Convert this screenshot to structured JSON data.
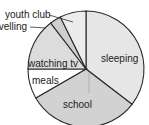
{
  "chart_data": {
    "type": "pie",
    "title": "",
    "unit": "hours",
    "total": 24,
    "start_angle_deg": 0,
    "direction": "clockwise",
    "categories": [
      "sleeping",
      "school",
      "meals",
      "watching tv",
      "travelling",
      "youth club"
    ],
    "values": [
      8.5,
      7.5,
      2,
      3.5,
      0.75,
      1.75
    ],
    "colors": [
      "#e6e6e6",
      "#d2d2d2",
      "#ffffff",
      "#dcdcdc",
      "#cfcfcf",
      "#ececec"
    ],
    "labels": {
      "sleeping": "sleeping",
      "school": "school",
      "meals": "meals",
      "watching_tv": "watching tv",
      "travelling": "travelling",
      "youth_club": "youth club"
    },
    "legend": "none (inline labels with leader lines)"
  }
}
